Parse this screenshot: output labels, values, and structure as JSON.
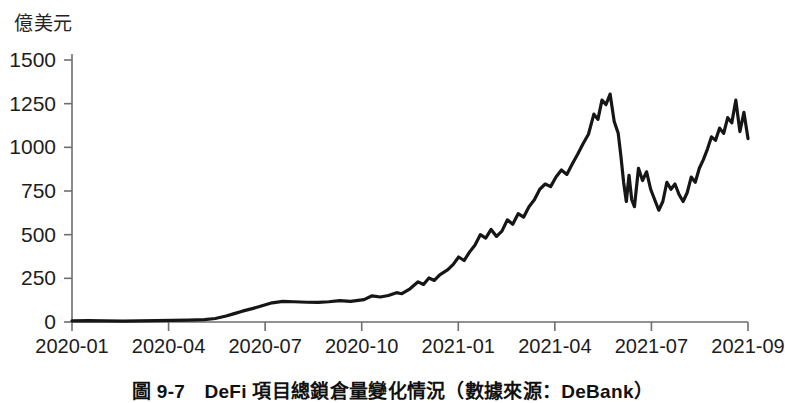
{
  "figure": {
    "unit_label": "億美元",
    "caption": "圖 9-7　DeFi 項目總鎖倉量變化情況（數據來源：DeBank）",
    "line_color": "#161616",
    "axis_color": "#6e6e6e",
    "background": "#ffffff"
  },
  "chart_data": {
    "type": "line",
    "title": "DeFi 項目總鎖倉量變化情況",
    "subtitle": "數據來源：DeBank",
    "xlabel": "",
    "ylabel": "億美元",
    "ylim": [
      0,
      1500
    ],
    "yticks": [
      0,
      250,
      500,
      750,
      1000,
      1250,
      1500
    ],
    "ytick_labels": [
      "0",
      "250",
      "500",
      "750",
      "1000",
      "1250",
      "1500"
    ],
    "xticks": [
      "2020-01",
      "2020-04",
      "2020-07",
      "2020-10",
      "2021-01",
      "2021-04",
      "2021-07",
      "2021-09"
    ],
    "grid": false,
    "legend": "none",
    "series": [
      {
        "name": "DeFi 總鎖倉量",
        "color": "#161616",
        "x": [
          "2020-01",
          "2020-02",
          "2020-03",
          "2020-04",
          "2020-05",
          "2020-06",
          "2020-07",
          "2020-08",
          "2020-09",
          "2020-10",
          "2020-11",
          "2020-12",
          "2021-01",
          "2021-02",
          "2021-03",
          "2021-04",
          "2021-05",
          "2021-06",
          "2021-07",
          "2021-08",
          "2021-09"
        ],
        "values": [
          7,
          9,
          6,
          7,
          9,
          14,
          42,
          85,
          110,
          112,
          125,
          160,
          250,
          420,
          560,
          870,
          1300,
          800,
          750,
          1050,
          1050
        ],
        "points": [
          {
            "x": 0.0,
            "y": 7
          },
          {
            "x": 0.6,
            "y": 8
          },
          {
            "x": 1.2,
            "y": 6
          },
          {
            "x": 1.9,
            "y": 5
          },
          {
            "x": 2.5,
            "y": 7
          },
          {
            "x": 3.1,
            "y": 8
          },
          {
            "x": 3.7,
            "y": 9
          },
          {
            "x": 4.3,
            "y": 11
          },
          {
            "x": 4.9,
            "y": 14
          },
          {
            "x": 5.3,
            "y": 20
          },
          {
            "x": 5.7,
            "y": 34
          },
          {
            "x": 6.0,
            "y": 48
          },
          {
            "x": 6.3,
            "y": 62
          },
          {
            "x": 6.7,
            "y": 78
          },
          {
            "x": 7.0,
            "y": 92
          },
          {
            "x": 7.4,
            "y": 110
          },
          {
            "x": 7.8,
            "y": 118
          },
          {
            "x": 8.2,
            "y": 116
          },
          {
            "x": 8.7,
            "y": 113
          },
          {
            "x": 9.1,
            "y": 112
          },
          {
            "x": 9.5,
            "y": 116
          },
          {
            "x": 9.9,
            "y": 122
          },
          {
            "x": 10.3,
            "y": 118
          },
          {
            "x": 10.8,
            "y": 128
          },
          {
            "x": 11.1,
            "y": 150
          },
          {
            "x": 11.4,
            "y": 143
          },
          {
            "x": 11.7,
            "y": 152
          },
          {
            "x": 12.0,
            "y": 168
          },
          {
            "x": 12.2,
            "y": 162
          },
          {
            "x": 12.5,
            "y": 190
          },
          {
            "x": 12.8,
            "y": 230
          },
          {
            "x": 13.0,
            "y": 215
          },
          {
            "x": 13.2,
            "y": 252
          },
          {
            "x": 13.4,
            "y": 238
          },
          {
            "x": 13.6,
            "y": 270
          },
          {
            "x": 13.9,
            "y": 300
          },
          {
            "x": 14.1,
            "y": 330
          },
          {
            "x": 14.3,
            "y": 372
          },
          {
            "x": 14.5,
            "y": 352
          },
          {
            "x": 14.7,
            "y": 400
          },
          {
            "x": 14.9,
            "y": 440
          },
          {
            "x": 15.1,
            "y": 500
          },
          {
            "x": 15.3,
            "y": 480
          },
          {
            "x": 15.5,
            "y": 530
          },
          {
            "x": 15.7,
            "y": 490
          },
          {
            "x": 15.9,
            "y": 520
          },
          {
            "x": 16.1,
            "y": 585
          },
          {
            "x": 16.3,
            "y": 560
          },
          {
            "x": 16.5,
            "y": 620
          },
          {
            "x": 16.7,
            "y": 600
          },
          {
            "x": 16.9,
            "y": 660
          },
          {
            "x": 17.1,
            "y": 700
          },
          {
            "x": 17.3,
            "y": 760
          },
          {
            "x": 17.5,
            "y": 790
          },
          {
            "x": 17.7,
            "y": 775
          },
          {
            "x": 17.9,
            "y": 830
          },
          {
            "x": 18.1,
            "y": 870
          },
          {
            "x": 18.3,
            "y": 845
          },
          {
            "x": 18.5,
            "y": 905
          },
          {
            "x": 18.7,
            "y": 960
          },
          {
            "x": 18.9,
            "y": 1020
          },
          {
            "x": 19.1,
            "y": 1075
          },
          {
            "x": 19.3,
            "y": 1190
          },
          {
            "x": 19.45,
            "y": 1160
          },
          {
            "x": 19.6,
            "y": 1270
          },
          {
            "x": 19.75,
            "y": 1245
          },
          {
            "x": 19.9,
            "y": 1305
          },
          {
            "x": 20.05,
            "y": 1150
          },
          {
            "x": 20.2,
            "y": 1080
          },
          {
            "x": 20.3,
            "y": 950
          },
          {
            "x": 20.4,
            "y": 800
          },
          {
            "x": 20.5,
            "y": 690
          },
          {
            "x": 20.6,
            "y": 840
          },
          {
            "x": 20.7,
            "y": 700
          },
          {
            "x": 20.8,
            "y": 660
          },
          {
            "x": 20.95,
            "y": 880
          },
          {
            "x": 21.1,
            "y": 810
          },
          {
            "x": 21.25,
            "y": 860
          },
          {
            "x": 21.4,
            "y": 760
          },
          {
            "x": 21.55,
            "y": 700
          },
          {
            "x": 21.7,
            "y": 640
          },
          {
            "x": 21.85,
            "y": 690
          },
          {
            "x": 22.0,
            "y": 800
          },
          {
            "x": 22.15,
            "y": 760
          },
          {
            "x": 22.3,
            "y": 790
          },
          {
            "x": 22.45,
            "y": 730
          },
          {
            "x": 22.6,
            "y": 690
          },
          {
            "x": 22.75,
            "y": 740
          },
          {
            "x": 22.9,
            "y": 830
          },
          {
            "x": 23.05,
            "y": 800
          },
          {
            "x": 23.2,
            "y": 880
          },
          {
            "x": 23.35,
            "y": 930
          },
          {
            "x": 23.5,
            "y": 990
          },
          {
            "x": 23.65,
            "y": 1060
          },
          {
            "x": 23.8,
            "y": 1040
          },
          {
            "x": 23.95,
            "y": 1110
          },
          {
            "x": 24.1,
            "y": 1080
          },
          {
            "x": 24.25,
            "y": 1170
          },
          {
            "x": 24.4,
            "y": 1140
          },
          {
            "x": 24.55,
            "y": 1270
          },
          {
            "x": 24.7,
            "y": 1090
          },
          {
            "x": 24.85,
            "y": 1200
          },
          {
            "x": 25.0,
            "y": 1050
          }
        ]
      }
    ]
  }
}
